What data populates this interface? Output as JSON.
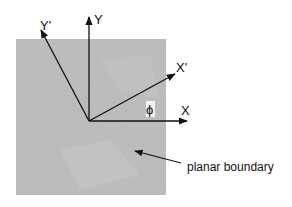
{
  "diagram": {
    "type": "coordinate-rotation",
    "region": {
      "label": "planar boundary",
      "fill": "#b9b9b9"
    },
    "axes": [
      {
        "id": "Y",
        "label": "Y"
      },
      {
        "id": "Y_prime",
        "label": "Y'"
      },
      {
        "id": "X",
        "label": "X"
      },
      {
        "id": "X_prime",
        "label": "X'"
      }
    ],
    "angle_label": "ϕ",
    "annotation": "planar boundary",
    "colors": {
      "background": "#ffffff",
      "region": "#b9b9b9",
      "ink": "#111111"
    }
  }
}
